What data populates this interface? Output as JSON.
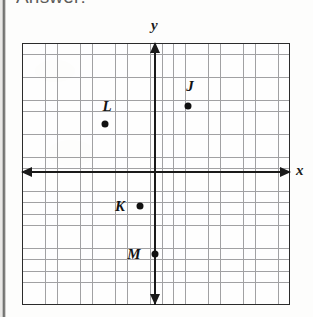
{
  "document": {
    "heading": "Answer:",
    "type": "coordinate-plane-worksheet"
  },
  "chart_data": {
    "type": "scatter",
    "title": "",
    "xlabel": "x",
    "ylabel": "y",
    "grid": true,
    "legend": false,
    "axis_style": "double-arrow",
    "gridlines_per_unit": 1,
    "xlim": [
      -11,
      12
    ],
    "ylim": [
      -12,
      11
    ],
    "tick_labels_shown": false,
    "points": [
      {
        "label": "J",
        "x": 3,
        "y": 2,
        "label_dx": 0,
        "label_dy": 2
      },
      {
        "label": "L",
        "x": -2.5,
        "y": 0.5,
        "label_dx": 0,
        "label_dy": 1.5
      },
      {
        "label": "K",
        "x": -1.5,
        "y": -3,
        "label_dx": -2,
        "label_dy": 0
      },
      {
        "label": "M",
        "x": 0,
        "y": -7,
        "label_dx": -2,
        "label_dy": 0
      }
    ],
    "pixel_points": [
      {
        "label": "J",
        "dot_x": 188,
        "dot_y": 106,
        "lbl_x": 190,
        "lbl_y": 86
      },
      {
        "label": "L",
        "dot_x": 105,
        "dot_y": 124,
        "lbl_x": 107,
        "lbl_y": 106
      },
      {
        "label": "K",
        "dot_x": 140,
        "dot_y": 206,
        "lbl_x": 120,
        "lbl_y": 206
      },
      {
        "label": "M",
        "dot_x": 155,
        "dot_y": 254,
        "lbl_x": 134,
        "lbl_y": 254
      }
    ]
  },
  "colors": {
    "grid_line": "#8e8e90",
    "axis": "#1a1a1a",
    "border": "#2b2b2b",
    "point": "#111111",
    "paper": "#fdfdfc"
  }
}
